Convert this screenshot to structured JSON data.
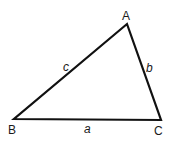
{
  "diagram": {
    "stroke_color": "#111111",
    "vertices": [
      {
        "label": "A",
        "x": 127,
        "y": 24
      },
      {
        "label": "B",
        "x": 14,
        "y": 119
      },
      {
        "label": "C",
        "x": 161,
        "y": 120
      }
    ],
    "sides": [
      {
        "label": "c",
        "from": "B",
        "to": "A"
      },
      {
        "label": "b",
        "from": "A",
        "to": "C"
      },
      {
        "label": "a",
        "from": "B",
        "to": "C"
      }
    ]
  }
}
